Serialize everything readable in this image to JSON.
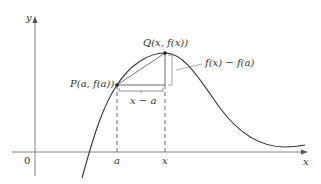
{
  "diagram": {
    "axis_labels": {
      "y": "y",
      "x": "x",
      "origin": "0"
    },
    "tick_labels": {
      "a": "a",
      "x": "x"
    },
    "points": {
      "P": "P(a, f(a))",
      "Q": "Q(x, f(x))"
    },
    "annotations": {
      "horizontal": "x − a",
      "vertical": "f(x) − f(a)"
    },
    "colors": {
      "curve": "#333333",
      "axis": "#555555"
    }
  }
}
